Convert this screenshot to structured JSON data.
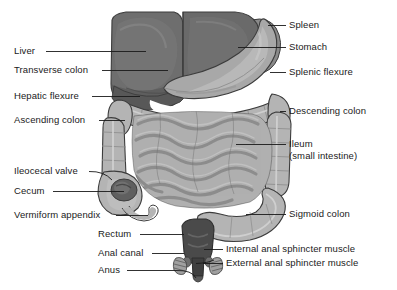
{
  "figure": {
    "background_color": "#ffffff",
    "text_color": "#1a1a1a",
    "leader_line_color": "#1a1a1a"
  },
  "palette": {
    "liver_dark": "#6e6e6e",
    "liver_shadow": "#5a5a5a",
    "liver_highlight": "#7d7d7d",
    "stomach": "#a8a8a8",
    "stomach_shadow": "#949494",
    "spleen": "#8a8a8a",
    "colon": "#b4b4b4",
    "colon_shadow": "#9e9e9e",
    "colon_highlight": "#c8c8c8",
    "ileum": "#b0b0b0",
    "ileum_shadow": "#9a9a9a",
    "rectum_dark": "#4a4a4a",
    "valve_dark": "#5f5f5f",
    "outline": "#3c3c3c",
    "white": "#ffffff"
  },
  "labels_left": [
    {
      "id": "liver",
      "text": "Liver",
      "x": 14,
      "y": 50,
      "line_x1": 46,
      "line_x2": 146,
      "line_y": 55
    },
    {
      "id": "transverse-colon",
      "text": "Transverse colon",
      "x": 14,
      "y": 69,
      "line_x1": 102,
      "line_x2": 168,
      "line_y": 74
    },
    {
      "id": "hepatic-flexure",
      "text": "Hepatic flexure",
      "x": 14,
      "y": 95,
      "line_x1": 92,
      "line_x2": 140,
      "line_y": 100
    },
    {
      "id": "ascending-colon",
      "text": "Ascending colon",
      "x": 14,
      "y": 119,
      "line_x1": 99,
      "line_x2": 125,
      "line_y": 124
    },
    {
      "id": "ileocecal-valve",
      "text": "Ileocecal valve",
      "x": 14,
      "y": 170,
      "line_x1": 89,
      "line_x2": 134,
      "line_y": 175
    },
    {
      "id": "cecum",
      "text": "Cecum",
      "x": 14,
      "y": 190,
      "line_x1": 53,
      "line_x2": 137,
      "line_y": 195
    },
    {
      "id": "vermiform-appendix",
      "text": "Vermiform appendix",
      "x": 14,
      "y": 214,
      "line_x1": 116,
      "line_x2": 153,
      "line_y": 219
    },
    {
      "id": "rectum",
      "text": "Rectum",
      "x": 98,
      "y": 233,
      "line_x1": 140,
      "line_x2": 186,
      "line_y": 238
    },
    {
      "id": "anal-canal",
      "text": "Anal canal",
      "x": 98,
      "y": 252,
      "line_x1": 152,
      "line_x2": 182,
      "line_y": 257
    },
    {
      "id": "anus",
      "text": "Anus",
      "x": 98,
      "y": 269,
      "line_x1": 127,
      "line_x2": 193,
      "line_y": 274
    }
  ],
  "labels_right": [
    {
      "id": "spleen",
      "text": "Spleen",
      "x": 288,
      "y": 24,
      "line_x1": 268,
      "line_x2": 284,
      "line_y": 29
    },
    {
      "id": "stomach",
      "text": "Stomach",
      "x": 288,
      "y": 46,
      "line_x1": 252,
      "line_x2": 284,
      "line_y": 51
    },
    {
      "id": "splenic-flexure",
      "text": "Splenic flexure",
      "x": 288,
      "y": 71,
      "line_x1": 268,
      "line_x2": 284,
      "line_y": 76
    },
    {
      "id": "descending-colon",
      "text": "Descending colon",
      "x": 288,
      "y": 110,
      "line_x1": 266,
      "line_x2": 284,
      "line_y": 115
    },
    {
      "id": "ileum",
      "text": "Ileum",
      "x": 288,
      "y": 143,
      "line_x1": 248,
      "line_x2": 284,
      "line_y": 148
    },
    {
      "id": "ileum-sub",
      "text": "(small intestine)",
      "x": 288,
      "y": 155,
      "line_x1": 0,
      "line_x2": 0,
      "line_y": 0
    },
    {
      "id": "sigmoid-colon",
      "text": "Sigmoid colon",
      "x": 288,
      "y": 213,
      "line_x1": 240,
      "line_x2": 284,
      "line_y": 218
    },
    {
      "id": "internal-anal-sphincter",
      "text": "Internal anal sphincter muscle",
      "x": 225,
      "y": 248,
      "line_x1": 206,
      "line_x2": 222,
      "line_y": 253
    },
    {
      "id": "external-anal-sphincter",
      "text": "External anal sphincter muscle",
      "x": 225,
      "y": 262,
      "line_x1": 196,
      "line_x2": 222,
      "line_y": 267
    }
  ],
  "organs": [
    {
      "id": "liver",
      "name": "Liver"
    },
    {
      "id": "stomach",
      "name": "Stomach"
    },
    {
      "id": "spleen",
      "name": "Spleen"
    },
    {
      "id": "transverse-colon",
      "name": "Transverse colon"
    },
    {
      "id": "hepatic-flexure",
      "name": "Hepatic flexure"
    },
    {
      "id": "splenic-flexure",
      "name": "Splenic flexure"
    },
    {
      "id": "ascending-colon",
      "name": "Ascending colon"
    },
    {
      "id": "descending-colon",
      "name": "Descending colon"
    },
    {
      "id": "ileum",
      "name": "Ileum (small intestine)"
    },
    {
      "id": "cecum",
      "name": "Cecum"
    },
    {
      "id": "ileocecal-valve",
      "name": "Ileocecal valve"
    },
    {
      "id": "vermiform-appendix",
      "name": "Vermiform appendix"
    },
    {
      "id": "sigmoid-colon",
      "name": "Sigmoid colon"
    },
    {
      "id": "rectum",
      "name": "Rectum"
    },
    {
      "id": "anal-canal",
      "name": "Anal canal"
    },
    {
      "id": "anus",
      "name": "Anus"
    },
    {
      "id": "internal-anal-sphincter",
      "name": "Internal anal sphincter muscle"
    },
    {
      "id": "external-anal-sphincter",
      "name": "External anal sphincter muscle"
    }
  ]
}
